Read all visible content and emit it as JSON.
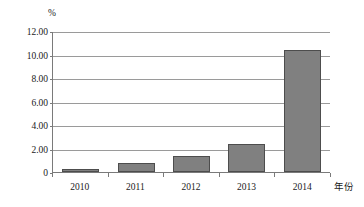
{
  "chart_data": {
    "type": "bar",
    "title": "",
    "subtitle": "",
    "categories": [
      "2010",
      "2011",
      "2012",
      "2013",
      "2014"
    ],
    "values": [
      0.25,
      0.8,
      1.4,
      2.4,
      10.4
    ],
    "series": [
      {
        "name": "",
        "values": [
          0.25,
          0.8,
          1.4,
          2.4,
          10.4
        ]
      }
    ],
    "xlabel": "年份",
    "ylabel": "%",
    "y_unit_caption": "%",
    "ylim": [
      0,
      12
    ],
    "ytick_values": [
      0,
      2,
      4,
      6,
      8,
      10,
      12
    ],
    "ytick_labels": [
      "0",
      "2.00",
      "4.00",
      "6.00",
      "8.00",
      "10.00",
      "12.00"
    ],
    "grid": true,
    "grid_axis": "y",
    "legend": false,
    "legend_position": "none",
    "bar_fill_color": "#808080",
    "bar_border_color": "#4d4d4d",
    "gridline_color": "#9a9a9a",
    "axis_color": "#7a7a7a",
    "background_color": "#ffffff"
  }
}
